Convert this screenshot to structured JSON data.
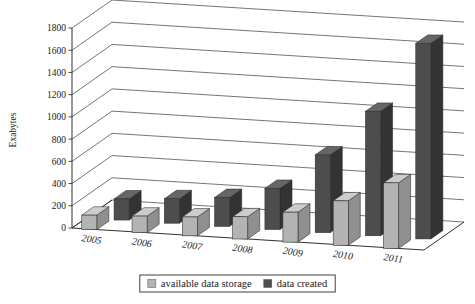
{
  "chart_data": {
    "type": "bar",
    "title": "",
    "subtitle": "",
    "xlabel": "",
    "ylabel": "Exabytes",
    "categories": [
      "2005",
      "2006",
      "2007",
      "2008",
      "2009",
      "2010",
      "2011"
    ],
    "series": [
      {
        "name": "available data storage",
        "color": "#b3b3b3",
        "values": [
          130,
          150,
          170,
          200,
          270,
          400,
          590
        ]
      },
      {
        "name": "data created",
        "color": "#4d4d4d",
        "values": [
          190,
          220,
          260,
          370,
          700,
          1120,
          1760
        ]
      }
    ],
    "ylim": [
      0,
      1800
    ],
    "yticks": [
      0,
      200,
      400,
      600,
      800,
      1000,
      1200,
      1400,
      1600,
      1800
    ],
    "ytick_labels": [
      "0",
      "200",
      "400",
      "600",
      "800",
      "1000",
      "1200",
      "1400",
      "1600",
      "1800"
    ],
    "grid": true,
    "legend_position": "bottom",
    "projection": "3d",
    "legend_entries": [
      {
        "label": "available data storage",
        "color": "#b3b3b3"
      },
      {
        "label": "data created",
        "color": "#4d4d4d"
      }
    ]
  },
  "legend": {
    "items": [
      {
        "label": "available data storage",
        "swatch": "legend-swatch-available-data-storage"
      },
      {
        "label": "data created",
        "swatch": "legend-swatch-data-created"
      }
    ]
  },
  "axes": {
    "y_axis_title": "Exabytes"
  },
  "colors": {
    "series_light": "#b3b3b3",
    "series_light_top": "#cccccc",
    "series_light_side": "#8f8f8f",
    "series_dark": "#4d4d4d",
    "series_dark_top": "#666666",
    "series_dark_side": "#333333",
    "axis": "#1a1a1a",
    "grid": "#3a3a3a",
    "background": "#ffffff"
  }
}
